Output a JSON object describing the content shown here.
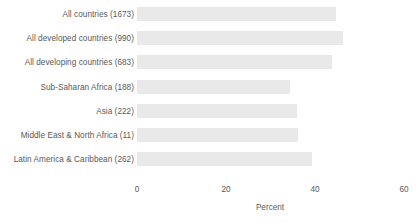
{
  "chart_data": {
    "type": "bar",
    "orientation": "horizontal",
    "title": "",
    "subtitle": "",
    "xlabel": "Percent",
    "ylabel": "",
    "xlim": [
      0,
      60
    ],
    "xticks": [
      0,
      20,
      40,
      60
    ],
    "xtick_labels": [
      "0",
      "20",
      "40",
      "60"
    ],
    "grid": false,
    "legend": null,
    "bar_color": "#e9e9e9",
    "text_color": "#58595b",
    "background_color": "#ffffff",
    "categories": [
      "All countries (1673)",
      "All developed countries (990)",
      "All developing countries (683)",
      "Sub-Saharan Africa (188)",
      "Asia (222)",
      "Middle East & North Africa (11)",
      "Latin America & Caribbean (262)"
    ],
    "values": [
      44.7,
      46.3,
      43.8,
      34.4,
      36.0,
      36.2,
      39.3
    ],
    "counts": [
      1673,
      990,
      683,
      188,
      222,
      11,
      262
    ]
  }
}
